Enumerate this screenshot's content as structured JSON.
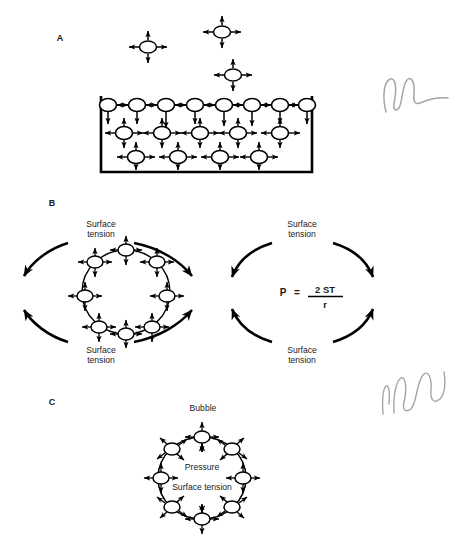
{
  "figure": {
    "background_color": "#ffffff",
    "ink_color": "#000000",
    "width": 467,
    "height": 552,
    "caption_hint": "Surface tension and bubble pressure diagram"
  },
  "panels": [
    {
      "id": "A",
      "label": "A",
      "label_x": 60,
      "label_y": 41,
      "description": "Liquid container with surface and interior molecules showing cohesive force arrows",
      "container": {
        "x": 101,
        "y": 98,
        "width": 211,
        "height": 74
      },
      "free_molecules": [
        {
          "cx": 148,
          "cy": 47,
          "arrows": [
            "up",
            "down",
            "left",
            "right"
          ]
        },
        {
          "cx": 222,
          "cy": 32,
          "arrows": [
            "up",
            "down",
            "left",
            "right"
          ]
        },
        {
          "cx": 233,
          "cy": 75,
          "arrows": [
            "up",
            "down",
            "left",
            "right"
          ]
        }
      ],
      "surface_molecules": [
        {
          "cx": 108,
          "cy": 105
        },
        {
          "cx": 137,
          "cy": 105
        },
        {
          "cx": 166,
          "cy": 105
        },
        {
          "cx": 195,
          "cy": 105
        },
        {
          "cx": 224,
          "cy": 105
        },
        {
          "cx": 252,
          "cy": 105
        },
        {
          "cx": 280,
          "cy": 105
        },
        {
          "cx": 307,
          "cy": 105
        }
      ],
      "interior_rows": [
        {
          "cy": 133,
          "molecules": [
            {
              "cx": 124
            },
            {
              "cx": 162
            },
            {
              "cx": 200
            },
            {
              "cx": 238
            },
            {
              "cx": 280
            }
          ]
        },
        {
          "cy": 157,
          "molecules": [
            {
              "cx": 136
            },
            {
              "cx": 178
            },
            {
              "cx": 220
            },
            {
              "cx": 259
            }
          ]
        }
      ]
    },
    {
      "id": "B",
      "label": "B",
      "label_x": 52,
      "label_y": 206,
      "description": "Left: droplet of molecules with surface tension arcs. Right: surface tension arcs with Laplace pressure formula",
      "left": {
        "circle": {
          "cx": 126,
          "cy": 292,
          "rx": 44,
          "ry": 42
        },
        "top_label_line1": "Surface",
        "top_label_line2": "tension",
        "bottom_label_line1": "Surface",
        "bottom_label_line2": "tension",
        "molecule_count": 8
      },
      "right": {
        "top_label_line1": "Surface",
        "top_label_line2": "tension",
        "bottom_label_line1": "Surface",
        "bottom_label_line2": "tension",
        "formula": {
          "lhs": "P",
          "equals": "=",
          "numerator": "2 ST",
          "denominator": "r",
          "full": "P = 2 ST / r"
        }
      }
    },
    {
      "id": "C",
      "label": "C",
      "label_x": 52,
      "label_y": 405,
      "description": "Bubble cross-section with inward pressure arrows and surface tension molecules",
      "title": "Bubble",
      "title_x": 203,
      "title_y": 411,
      "circle": {
        "cx": 202,
        "cy": 478,
        "rx": 44,
        "ry": 41
      },
      "inner_label_1": "Pressure",
      "inner_label_2": "Surface tension",
      "molecule_count": 8
    }
  ],
  "annotations": {
    "pencil_marks": [
      {
        "name": "pencil-scribble-top",
        "x": 380,
        "y": 70,
        "width": 75,
        "height": 45
      },
      {
        "name": "pencil-scribble-bottom",
        "x": 380,
        "y": 368,
        "width": 70,
        "height": 48
      }
    ]
  }
}
